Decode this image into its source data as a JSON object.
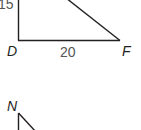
{
  "figure_1": {
    "vertices": {
      "bottom_left": "D",
      "bottom_right": "F"
    },
    "side_labels": {
      "vertical_leg": "15",
      "base": "20"
    }
  },
  "figure_2": {
    "vertices": {
      "top": "N"
    }
  },
  "colors": {
    "line": "#231f20",
    "number_label": "#555555"
  }
}
